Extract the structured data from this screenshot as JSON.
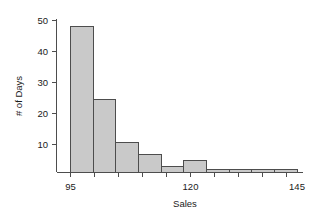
{
  "chart_data": {
    "type": "bar",
    "title": "",
    "subtitle": "",
    "xlabel": "Sales",
    "ylabel": "# of Days",
    "categories": [
      "95-100",
      "100-105",
      "105-110",
      "110-115",
      "115-120",
      "120-125",
      "125-130",
      "130-135",
      "135-140",
      "140-145"
    ],
    "bin_edges": [
      95,
      100,
      105,
      110,
      115,
      120,
      125,
      130,
      135,
      140,
      145
    ],
    "values": [
      48,
      24,
      10,
      6,
      2,
      4,
      1,
      1,
      1,
      1
    ],
    "x": [
      97.5,
      102.5,
      107.5,
      112.5,
      117.5,
      122.5,
      127.5,
      132.5,
      137.5,
      142.5
    ],
    "xlim": [
      95,
      145
    ],
    "ylim": [
      0,
      50
    ],
    "x_ticks": [
      95,
      100,
      105,
      110,
      115,
      120,
      125,
      130,
      135,
      140,
      145
    ],
    "x_tick_labels": [
      "95",
      "",
      "",
      "",
      "",
      "120",
      "",
      "",
      "",
      "",
      "145"
    ],
    "x_tick_labels_visible": [
      "95",
      "120",
      "145"
    ],
    "y_ticks": [
      10,
      20,
      30,
      40,
      50
    ],
    "y_tick_labels": [
      "10",
      "20",
      "30",
      "40",
      "50"
    ],
    "grid": false,
    "legend": null,
    "bar_fill": "#c9c9c9",
    "bar_stroke": "#4d4d4d",
    "axis_color": "#4d4d4d",
    "background": "#ffffff"
  },
  "axes": {
    "y_label": "# of Days",
    "x_label": "Sales",
    "y_tick_0": "10",
    "y_tick_1": "20",
    "y_tick_2": "30",
    "y_tick_3": "40",
    "y_tick_4": "50",
    "x_tick_0": "95",
    "x_tick_1": "120",
    "x_tick_2": "145"
  }
}
